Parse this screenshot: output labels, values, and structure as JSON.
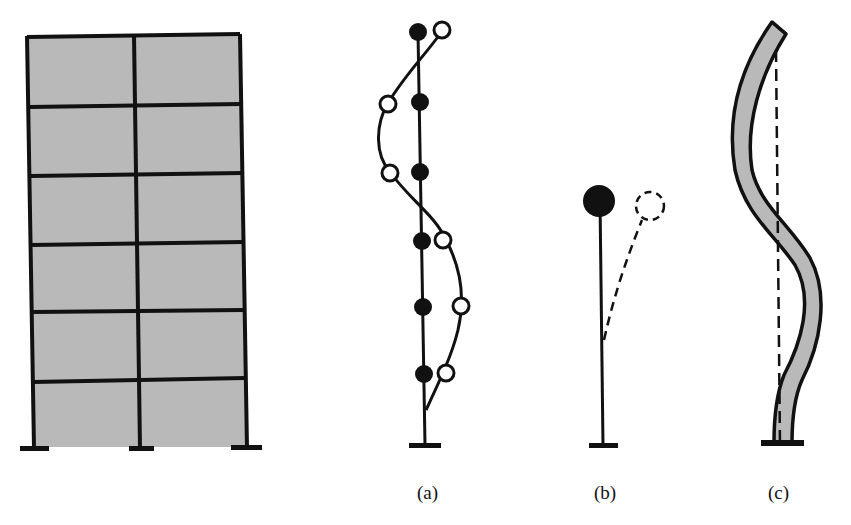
{
  "figure": {
    "panels": [
      {
        "id": "frame",
        "label": "",
        "description": "Six-storey, two-bay frame building elevation with fixed supports"
      },
      {
        "id": "a",
        "label": "(a)",
        "description": "Lumped-mass stick model: six solid masses on vertical axis; open circles show higher mode shape"
      },
      {
        "id": "b",
        "label": "(b)",
        "description": "Single-degree-of-freedom inverted pendulum with solid mass; dashed deflected shape"
      },
      {
        "id": "c",
        "label": "(c)",
        "description": "Continuous cantilever with deflected S-shape; dashed line shows undeformed axis"
      }
    ],
    "frame": {
      "storeys": 6,
      "bays": 2,
      "fill_color": "#b9b9b9",
      "line_color": "#111111"
    },
    "colors": {
      "ink": "#111111",
      "fill": "#b9b9b9",
      "background": "#ffffff"
    }
  }
}
